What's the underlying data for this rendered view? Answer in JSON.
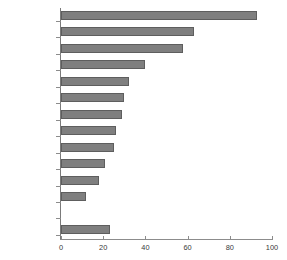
{
  "chart_data": {
    "type": "bar",
    "orientation": "horizontal",
    "title": "",
    "subtitle": "",
    "xlabel": "",
    "ylabel": "",
    "xlim": [
      0,
      100
    ],
    "xticks": [
      0,
      20,
      40,
      60,
      80,
      100
    ],
    "grid": false,
    "legend": null,
    "bar_color": "#7f7f7f",
    "bar_edge_color": "#5e5e5e",
    "axis_color": "#8c8c8c",
    "text_color": "#3a3a3a",
    "categories": [
      "Luxembourg",
      "Ireland",
      "Netherlands",
      "Portugal",
      "Spain",
      "Belgium",
      "Austria",
      "Greece",
      "Finland",
      "France",
      "Germany",
      "Italy",
      "",
      "Euro area"
    ],
    "values": [
      93,
      63,
      58,
      40,
      32,
      30,
      29,
      26,
      25,
      21,
      18,
      12,
      null,
      23
    ],
    "bars": [
      {
        "label": "Luxembourg",
        "value": 93
      },
      {
        "label": "Ireland",
        "value": 63
      },
      {
        "label": "Netherlands",
        "value": 58
      },
      {
        "label": "Portugal",
        "value": 40
      },
      {
        "label": "Spain",
        "value": 32
      },
      {
        "label": "Belgium",
        "value": 30
      },
      {
        "label": "Austria",
        "value": 29
      },
      {
        "label": "Greece",
        "value": 26
      },
      {
        "label": "Finland",
        "value": 25
      },
      {
        "label": "France",
        "value": 21
      },
      {
        "label": "Germany",
        "value": 18
      },
      {
        "label": "Italy",
        "value": 12
      },
      {
        "label": "",
        "value": null
      },
      {
        "label": "Euro area",
        "value": 23
      }
    ]
  }
}
